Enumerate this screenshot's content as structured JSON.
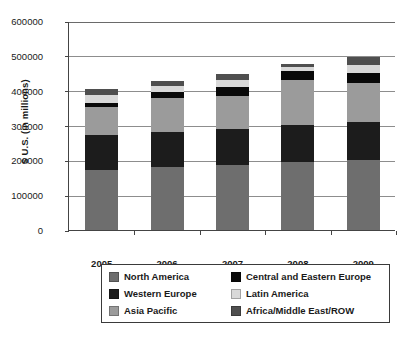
{
  "chart_data": {
    "type": "bar",
    "subtype": "stacked-vertical",
    "title": "",
    "xlabel": "",
    "ylabel": "$ U.S. (in millions)",
    "categories": [
      "2005",
      "2006",
      "2007",
      "2008",
      "2009"
    ],
    "ylim": [
      0,
      600000
    ],
    "yticks": [
      0,
      100000,
      200000,
      300000,
      400000,
      500000,
      600000
    ],
    "ytick_labels": [
      "0",
      "100000",
      "200000",
      "300000",
      "400000",
      "500000",
      "600000"
    ],
    "grid": true,
    "legend_position": "below",
    "series": [
      {
        "name": "North America",
        "color": "#6e6e6e",
        "values": [
          172000,
          182000,
          186000,
          196000,
          200000
        ]
      },
      {
        "name": "Western Europe",
        "color": "#1c1c1c",
        "values": [
          100000,
          98000,
          104000,
          106000,
          111000
        ]
      },
      {
        "name": "Asia Pacific",
        "color": "#9b9b9b",
        "values": [
          82000,
          100000,
          96000,
          130000,
          112000
        ]
      },
      {
        "name": "Central and Eastern Europe",
        "color": "#0a0a0a",
        "values": [
          12000,
          15000,
          25000,
          25000,
          28000
        ]
      },
      {
        "name": "Latin America",
        "color": "#d9d9d9",
        "values": [
          22000,
          18000,
          20000,
          12000,
          22000
        ]
      },
      {
        "name": "Africa/Middle East/ROW",
        "color": "#4f4f4f",
        "values": [
          16000,
          14000,
          16000,
          7000,
          25000
        ]
      }
    ],
    "totals": [
      404000,
      427000,
      447000,
      476000,
      498000
    ]
  },
  "legend": {
    "items": [
      {
        "label": "North America",
        "color": "#6e6e6e"
      },
      {
        "label": "Central and Eastern Europe",
        "color": "#0a0a0a"
      },
      {
        "label": "Western Europe",
        "color": "#1c1c1c"
      },
      {
        "label": "Latin America",
        "color": "#d9d9d9"
      },
      {
        "label": "Asia Pacific",
        "color": "#9b9b9b"
      },
      {
        "label": "Africa/Middle East/ROW",
        "color": "#4f4f4f"
      }
    ]
  },
  "axes": {
    "y_title": "$ U.S. (in millions)"
  }
}
